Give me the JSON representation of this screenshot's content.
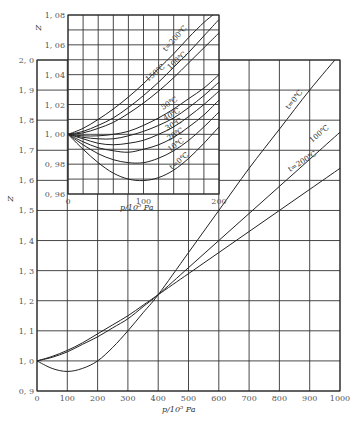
{
  "chart_data": [
    {
      "id": "main",
      "type": "line",
      "title": "",
      "xlabel": "p/10^5 Pa",
      "ylabel": "Z",
      "xlim": [
        0,
        1000
      ],
      "ylim": [
        0.9,
        2.0
      ],
      "grid": true,
      "xticks": [
        0,
        100,
        200,
        300,
        400,
        500,
        600,
        700,
        800,
        900,
        1000
      ],
      "xtick_labels": [
        "0",
        "100",
        "200",
        "300",
        "400",
        "500",
        "600",
        "700",
        "800",
        "900",
        "1000"
      ],
      "yticks": [
        0.9,
        1.0,
        1.1,
        1.2,
        1.3,
        1.4,
        1.5,
        1.6,
        1.7,
        1.8,
        1.9,
        2.0
      ],
      "ytick_labels": [
        "0.9",
        "1.0",
        "1.1",
        "1.2",
        "1.3",
        "1.4",
        "1.5",
        "1.6",
        "1.7",
        "1.8",
        "1.9",
        "2.0"
      ],
      "series": [
        {
          "name": "t=0℃",
          "x": [
            0,
            50,
            100,
            150,
            200,
            250,
            300,
            350,
            400,
            500,
            600,
            700,
            800,
            900,
            1000
          ],
          "y": [
            1.0,
            0.975,
            0.965,
            0.975,
            1.0,
            1.045,
            1.1,
            1.16,
            1.22,
            1.36,
            1.5,
            1.64,
            1.77,
            1.9,
            2.02
          ]
        },
        {
          "name": "100℃",
          "x": [
            0,
            50,
            100,
            150,
            200,
            250,
            300,
            350,
            400,
            500,
            600,
            700,
            800,
            900,
            1000
          ],
          "y": [
            1.0,
            1.012,
            1.03,
            1.055,
            1.08,
            1.11,
            1.14,
            1.18,
            1.22,
            1.31,
            1.4,
            1.49,
            1.58,
            1.67,
            1.76
          ]
        },
        {
          "name": "t=200℃",
          "x": [
            0,
            50,
            100,
            150,
            200,
            250,
            300,
            350,
            400,
            500,
            600,
            700,
            800,
            900,
            1000
          ],
          "y": [
            1.0,
            1.015,
            1.035,
            1.06,
            1.09,
            1.12,
            1.15,
            1.185,
            1.22,
            1.29,
            1.36,
            1.43,
            1.5,
            1.57,
            1.64
          ]
        }
      ],
      "annotations": [
        "t=0℃",
        "100℃",
        "t=200℃"
      ]
    },
    {
      "id": "inset",
      "type": "line",
      "title": "",
      "xlabel": "p/10^5 Pa",
      "ylabel": "Z",
      "xlim": [
        0,
        200
      ],
      "ylim": [
        0.96,
        1.08
      ],
      "grid": true,
      "xticks": [
        0,
        100,
        200
      ],
      "xtick_labels": [
        "0",
        "100",
        "200"
      ],
      "yticks": [
        0.96,
        0.98,
        1.0,
        1.02,
        1.04,
        1.06,
        1.08
      ],
      "ytick_labels": [
        "0.96",
        "0.98",
        "1.00",
        "1.02",
        "1.04",
        "1.06",
        "1.08"
      ],
      "series": [
        {
          "name": "t=200℃",
          "x": [
            0,
            20,
            40,
            60,
            80,
            100,
            120,
            140,
            160,
            180,
            192
          ],
          "y": [
            1.0,
            1.004,
            1.01,
            1.017,
            1.025,
            1.034,
            1.044,
            1.054,
            1.065,
            1.075,
            1.08
          ]
        },
        {
          "name": "150℃",
          "x": [
            0,
            20,
            40,
            60,
            80,
            100,
            120,
            140,
            160,
            180,
            200
          ],
          "y": [
            1.0,
            1.002,
            1.006,
            1.011,
            1.018,
            1.026,
            1.035,
            1.045,
            1.055,
            1.066,
            1.077
          ]
        },
        {
          "name": "100℃",
          "x": [
            0,
            20,
            40,
            60,
            80,
            100,
            120,
            140,
            160,
            180,
            200
          ],
          "y": [
            1.0,
            1.001,
            1.004,
            1.008,
            1.014,
            1.021,
            1.029,
            1.038,
            1.048,
            1.058,
            1.068
          ]
        },
        {
          "name": "50℃",
          "x": [
            0,
            20,
            40,
            60,
            80,
            100,
            120,
            140,
            160,
            180,
            200
          ],
          "y": [
            1.0,
            0.999,
            0.999,
            1.0,
            1.002,
            1.006,
            1.011,
            1.017,
            1.024,
            1.031,
            1.04
          ]
        },
        {
          "name": "40℃",
          "x": [
            0,
            20,
            40,
            60,
            80,
            100,
            120,
            140,
            160,
            180,
            200
          ],
          "y": [
            1.0,
            0.998,
            0.997,
            0.997,
            0.999,
            1.002,
            1.006,
            1.011,
            1.018,
            1.026,
            1.035
          ]
        },
        {
          "name": "30℃",
          "x": [
            0,
            20,
            40,
            60,
            80,
            100,
            120,
            140,
            160,
            180,
            200
          ],
          "y": [
            1.0,
            0.997,
            0.994,
            0.993,
            0.994,
            0.996,
            1.0,
            1.005,
            1.012,
            1.02,
            1.029
          ]
        },
        {
          "name": "20℃",
          "x": [
            0,
            20,
            40,
            60,
            80,
            100,
            120,
            140,
            160,
            180,
            200
          ],
          "y": [
            1.0,
            0.995,
            0.991,
            0.989,
            0.988,
            0.99,
            0.993,
            0.998,
            1.005,
            1.013,
            1.023
          ]
        },
        {
          "name": "10℃",
          "x": [
            0,
            20,
            40,
            60,
            80,
            100,
            120,
            140,
            160,
            180,
            200
          ],
          "y": [
            1.0,
            0.993,
            0.987,
            0.983,
            0.981,
            0.981,
            0.984,
            0.989,
            0.996,
            1.005,
            1.015
          ]
        },
        {
          "name": "t=0℃",
          "x": [
            0,
            20,
            40,
            60,
            80,
            100,
            120,
            140,
            160,
            180,
            200
          ],
          "y": [
            1.0,
            0.99,
            0.981,
            0.974,
            0.97,
            0.969,
            0.971,
            0.976,
            0.984,
            0.994,
            1.005
          ]
        }
      ],
      "annotations": [
        "t=200℃",
        "150℃",
        "100℃",
        "50℃",
        "40℃",
        "30℃",
        "20℃",
        "10℃",
        "t=0℃"
      ]
    }
  ],
  "labels": {
    "main_ylabel": "Z",
    "main_xlabel": "p/10⁵ Pa",
    "inset_ylabel": "Z",
    "inset_xlabel": "p/10⁵ Pa"
  }
}
